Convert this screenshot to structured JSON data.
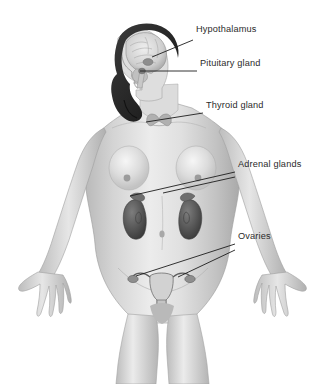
{
  "figure": {
    "style": "grayscale-medical-illustration",
    "background_color": "#ffffff",
    "skin_color": "#d8d8d8",
    "hair_color": "#2e2e2e",
    "organ_color": "#5a5a5a",
    "leader_line_color": "#1d1d1d",
    "label_text_color": "#2b2b2b"
  },
  "labels": [
    {
      "id": "hypothalamus",
      "text": "Hypothalamus",
      "x": 196,
      "y": 30,
      "leader": {
        "x1": 193,
        "y1": 40,
        "x2": 152,
        "y2": 57
      }
    },
    {
      "id": "pituitary-gland",
      "text": "Pituitary gland",
      "x": 200,
      "y": 64,
      "leader": {
        "x1": 197,
        "y1": 71,
        "x2": 140,
        "y2": 71
      }
    },
    {
      "id": "thyroid-gland",
      "text": "Thyroid gland",
      "x": 206,
      "y": 106,
      "leader": {
        "x1": 203,
        "y1": 113,
        "x2": 146,
        "y2": 122
      }
    },
    {
      "id": "adrenal-glands",
      "text": "Adrenal glands",
      "x": 238,
      "y": 165,
      "leader": {
        "x1": 235,
        "y1": 172,
        "x2": 130,
        "y2": 196
      },
      "leader2": {
        "x1": 235,
        "y1": 177,
        "x2": 163,
        "y2": 193
      }
    },
    {
      "id": "ovaries",
      "text": "Ovaries",
      "x": 238,
      "y": 237,
      "leader": {
        "x1": 235,
        "y1": 244,
        "x2": 136,
        "y2": 276
      },
      "leader2": {
        "x1": 235,
        "y1": 250,
        "x2": 173,
        "y2": 277
      }
    }
  ],
  "organs": [
    {
      "id": "brain",
      "name": "brain"
    },
    {
      "id": "hypothalamus-gland",
      "name": "hypothalamus"
    },
    {
      "id": "pituitary-gland-organ",
      "name": "pituitary gland"
    },
    {
      "id": "thyroid-gland-organ",
      "name": "thyroid gland"
    },
    {
      "id": "adrenal-left",
      "name": "left adrenal gland"
    },
    {
      "id": "adrenal-right",
      "name": "right adrenal gland"
    },
    {
      "id": "kidney-left",
      "name": "left kidney"
    },
    {
      "id": "kidney-right",
      "name": "right kidney"
    },
    {
      "id": "uterus",
      "name": "uterus"
    },
    {
      "id": "ovary-left",
      "name": "left ovary"
    },
    {
      "id": "ovary-right",
      "name": "right ovary"
    }
  ]
}
